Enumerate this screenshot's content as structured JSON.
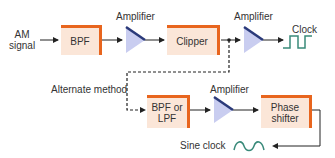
{
  "diagram": {
    "input_label": "AM signal",
    "input_label_lines": [
      "AM",
      "signal"
    ],
    "blocks": {
      "bpf": "BPF",
      "clipper": "Clipper",
      "bpf_or_lpf_lines": [
        "BPF or",
        "LPF"
      ],
      "phase_shifter_lines": [
        "Phase",
        "shifter"
      ]
    },
    "amplifiers": [
      "Amplifier",
      "Amplifier",
      "Amplifier"
    ],
    "outputs": {
      "clock": "Clock",
      "sine_clock": "Sine clock"
    },
    "alternate_label": "Alternate method",
    "colors": {
      "block_fill": "#fbe6d8",
      "block_edge": "#e8651e",
      "amp_fill": "#c9cdf0",
      "amp_edge": "#2b3a7a",
      "wave": "#3a8a7a",
      "line": "#222222"
    }
  }
}
